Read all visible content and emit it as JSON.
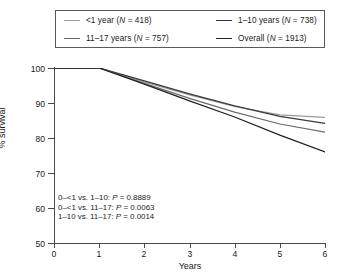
{
  "chart_data": {
    "type": "line",
    "title": "",
    "xlabel": "Years",
    "ylabel": "% survival",
    "xlim": [
      0,
      6
    ],
    "ylim": [
      50,
      100
    ],
    "xticks": [
      "0",
      "1",
      "2",
      "3",
      "4",
      "5",
      "6"
    ],
    "yticks": [
      "50",
      "60",
      "70",
      "80",
      "90",
      "100"
    ],
    "grid": false,
    "legend_position": "top",
    "x": [
      0,
      1,
      2,
      3,
      4,
      5,
      6
    ],
    "series": [
      {
        "name": "<1 year",
        "label": "<1 year (N = 418)",
        "n": 418,
        "color": "#9a9a9a",
        "values": [
          100,
          100,
          96.0,
          92.3,
          89.0,
          86.6,
          85.9
        ]
      },
      {
        "name": "1-10 years",
        "label": "1–10 years (N = 738)",
        "n": 738,
        "color": "#3a3a3a",
        "values": [
          100,
          100,
          96.3,
          92.6,
          89.2,
          86.2,
          84.2
        ]
      },
      {
        "name": "11-17 years",
        "label": "11–17 years (N = 757)",
        "n": 757,
        "color": "#6a6a6a",
        "values": [
          100,
          100,
          95.6,
          91.3,
          87.4,
          84.0,
          81.7
        ]
      },
      {
        "name": "Overall",
        "label": "Overall (N = 1913)",
        "n": 1913,
        "color": "#222222",
        "values": [
          100,
          100,
          95.4,
          90.6,
          86.0,
          80.8,
          76.0
        ]
      }
    ],
    "annotations": [
      "0–<1 vs. 1–10: P = 0.8889",
      "0–<1 vs. 11–17: P = 0.0063",
      "1–10 vs. 11–17: P = 0.0014"
    ],
    "annotation_rows": [
      {
        "comparison": "0–<1 vs. 1–10:",
        "p_label": "P",
        "p_value": "= 0.8889"
      },
      {
        "comparison": "0–<1 vs. 11–17:",
        "p_label": "P",
        "p_value": "= 0.0063"
      },
      {
        "comparison": "1–10 vs. 11–17:",
        "p_label": "P",
        "p_value": "= 0.0014"
      }
    ]
  },
  "legend": {
    "entries": [
      {
        "text_before_n": "<1 year (",
        "n_label": "N",
        "text_after_n": " = 418)",
        "color": "#9a9a9a"
      },
      {
        "text_before_n": "1–10 years (",
        "n_label": "N",
        "text_after_n": " = 738)",
        "color": "#3a3a3a"
      },
      {
        "text_before_n": "11–17 years (",
        "n_label": "N",
        "text_after_n": " = 757)",
        "color": "#6a6a6a"
      },
      {
        "text_before_n": "Overall (",
        "n_label": "N",
        "text_after_n": " = 1913)",
        "color": "#222222"
      }
    ]
  },
  "axes": {
    "y_title": "% survival",
    "x_title": "Years",
    "y_ticks": [
      "100",
      "90",
      "80",
      "70",
      "60",
      "50"
    ],
    "x_ticks": [
      "0",
      "1",
      "2",
      "3",
      "4",
      "5",
      "6"
    ]
  }
}
